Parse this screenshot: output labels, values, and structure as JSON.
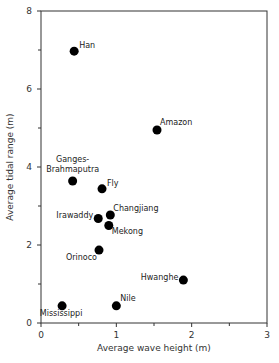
{
  "chart_data": {
    "type": "scatter",
    "title": "",
    "xlabel": "Average wave height (m)",
    "ylabel": "Average tidal range (m)",
    "xlim": [
      0,
      3
    ],
    "ylim": [
      0,
      8
    ],
    "xticks": [
      0,
      1,
      2,
      3
    ],
    "xminor": [
      0.5,
      1.5,
      2.5
    ],
    "yticks": [
      0,
      2,
      4,
      6,
      8
    ],
    "yminor": [
      1,
      3,
      5,
      7
    ],
    "grid": false,
    "legend": null,
    "marker_color": "#000000",
    "points": [
      {
        "name": "Han",
        "x": 0.44,
        "y": 6.97,
        "label_dx": 5,
        "label_dy": -3,
        "anchor": "start"
      },
      {
        "name": "Amazon",
        "x": 1.54,
        "y": 4.95,
        "label_dx": 3,
        "label_dy": -5,
        "anchor": "start"
      },
      {
        "name": "Ganges-",
        "name2": "Brahmaputra",
        "x": 0.42,
        "y": 3.64,
        "label_dx": 0,
        "label_dy": -19,
        "anchor": "middle"
      },
      {
        "name": "Fly",
        "x": 0.81,
        "y": 3.44,
        "label_dx": 5,
        "label_dy": -3,
        "anchor": "start"
      },
      {
        "name": "Changjiang",
        "x": 0.92,
        "y": 2.77,
        "label_dx": 3,
        "label_dy": -4,
        "anchor": "start"
      },
      {
        "name": "Irawaddy",
        "x": 0.76,
        "y": 2.68,
        "label_dx": -5,
        "label_dy": 0,
        "anchor": "end"
      },
      {
        "name": "Mekong",
        "x": 0.9,
        "y": 2.5,
        "label_dx": 3,
        "label_dy": 8,
        "anchor": "start"
      },
      {
        "name": "Orinoco",
        "x": 0.77,
        "y": 1.87,
        "label_dx": -2,
        "label_dy": 10,
        "anchor": "end"
      },
      {
        "name": "Hwanghe",
        "x": 1.89,
        "y": 1.1,
        "label_dx": -5,
        "label_dy": 0,
        "anchor": "end"
      },
      {
        "name": "Nile",
        "x": 1.0,
        "y": 0.44,
        "label_dx": 4,
        "label_dy": -5,
        "anchor": "start"
      },
      {
        "name": "Mississippi",
        "x": 0.28,
        "y": 0.44,
        "label_dx": -1,
        "label_dy": 10,
        "anchor": "middle"
      }
    ]
  }
}
